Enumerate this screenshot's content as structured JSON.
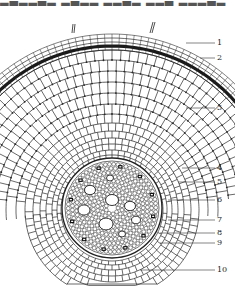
{
  "header": {
    "cropped_text": "▂▃▂▂▃▂ ▂▃▂▂ ▂▂▃▂ ▂▂▃ ▂▂▂▃▂"
  },
  "figure": {
    "type": "botanical cross-section diagram (root)",
    "labels": [
      {
        "n": "1",
        "y": 43
      },
      {
        "n": "2",
        "y": 58
      },
      {
        "n": "3",
        "y": 108
      },
      {
        "n": "4",
        "y": 168
      },
      {
        "n": "5",
        "y": 182
      },
      {
        "n": "6",
        "y": 200
      },
      {
        "n": "7",
        "y": 220
      },
      {
        "n": "8",
        "y": 233
      },
      {
        "n": "9",
        "y": 243
      },
      {
        "n": "10",
        "y": 270
      }
    ],
    "colors": {
      "ink": "#222222",
      "background": "#ffffff",
      "dark_layer": "#1a1a1a"
    }
  }
}
